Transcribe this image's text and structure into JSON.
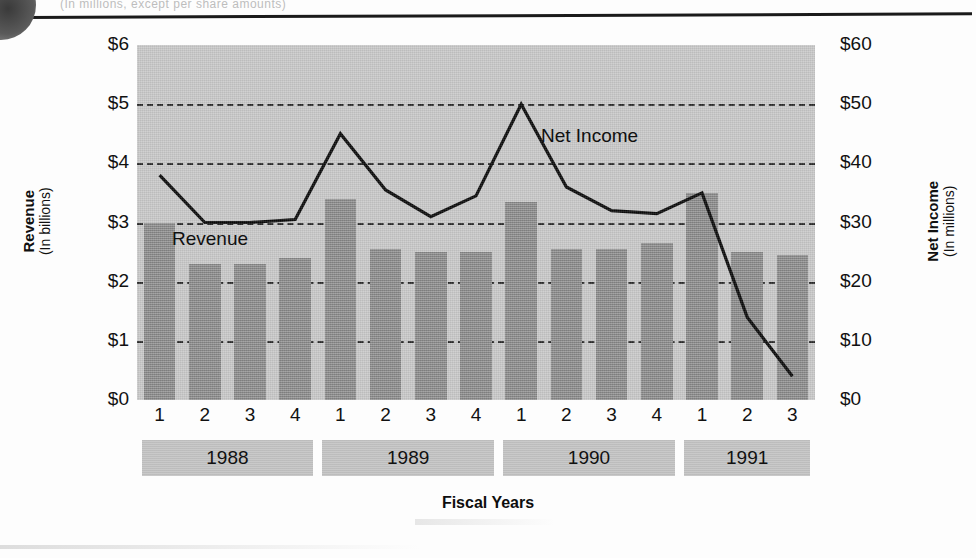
{
  "page": {
    "ghost_header_text": "(In millions, except per share amounts)"
  },
  "chart": {
    "y_axis_left": {
      "title": "Revenue",
      "subtitle": "(In billions)"
    },
    "y_axis_right": {
      "title": "Net Income",
      "subtitle": "(In millions)"
    },
    "x_axis_title": "Fiscal Years",
    "series_labels": {
      "revenue": "Revenue",
      "net_income": "Net Income"
    },
    "colors": {
      "bar": "#8e8e8e",
      "plot_background": "#c9c9c9",
      "gridline": "#2c2c2c",
      "line": "#0a0a0a",
      "year_band": "#c4c4c4"
    }
  },
  "chart_data": {
    "type": "bar",
    "title": "",
    "subtitle": "",
    "xlabel": "Fiscal Years",
    "categories": [
      "1",
      "2",
      "3",
      "4",
      "1",
      "2",
      "3",
      "4",
      "1",
      "2",
      "3",
      "4",
      "1",
      "2",
      "3"
    ],
    "group_labels": [
      "1988",
      "1989",
      "1990",
      "1991"
    ],
    "group_sizes": [
      4,
      4,
      4,
      3
    ],
    "grid": true,
    "legend": "inline-annotations",
    "series": [
      {
        "name": "Revenue",
        "chart_type": "bar",
        "axis": "left",
        "unit": "billions of dollars",
        "ylabel": "Revenue (In billions)",
        "ylim": [
          0,
          6
        ],
        "yticks": [
          0,
          1,
          2,
          3,
          4,
          5,
          6
        ],
        "ytick_labels": [
          "$0",
          "$1",
          "$2",
          "$3",
          "$4",
          "$5",
          "$6"
        ],
        "values": [
          3.0,
          2.3,
          2.3,
          2.4,
          3.4,
          2.55,
          2.5,
          2.5,
          3.35,
          2.55,
          2.55,
          2.65,
          3.5,
          2.5,
          2.45
        ]
      },
      {
        "name": "Net Income",
        "chart_type": "line",
        "axis": "right",
        "unit": "millions of dollars",
        "ylabel": "Net Income (In millions)",
        "ylim": [
          0,
          60
        ],
        "yticks": [
          0,
          10,
          20,
          30,
          40,
          50,
          60
        ],
        "ytick_labels": [
          "$0",
          "$10",
          "$20",
          "$30",
          "$40",
          "$50",
          "$60"
        ],
        "values": [
          38,
          30,
          30,
          30.5,
          45,
          35.5,
          31,
          34.5,
          50,
          36,
          32,
          31.5,
          35,
          14,
          4
        ]
      }
    ]
  }
}
